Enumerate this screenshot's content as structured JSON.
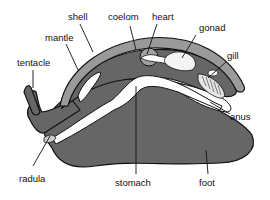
{
  "diagram": {
    "colors": {
      "body": "#666666",
      "shell": "#9a9a9a",
      "mantle_cavity": "#ffffff",
      "outline": "#111111",
      "coelom": "#a0a0a0",
      "label_text": "#111111"
    },
    "labels": {
      "shell": "shell",
      "coelom": "coelom",
      "heart": "heart",
      "gonad": "gonad",
      "mantle": "mantle",
      "gill": "gill",
      "tentacle": "tentacle",
      "anus": "anus",
      "radula": "radula",
      "stomach": "stomach",
      "foot": "foot"
    }
  }
}
